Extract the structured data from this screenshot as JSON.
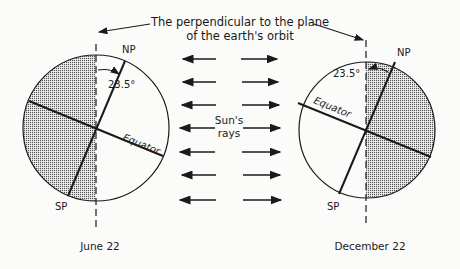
{
  "title_line1": "The perpendicular to the plane",
  "title_line2": "of the earth's orbit",
  "left": {
    "date": "June 22",
    "north_pole": "NP",
    "south_pole": "SP",
    "angle": "23.5°",
    "equator": "Equator"
  },
  "right": {
    "date": "December 22",
    "north_pole": "NP",
    "south_pole": "SP",
    "angle": "23.5°",
    "equator": "Equator"
  },
  "sun": {
    "line1": "Sun's",
    "line2": "rays",
    "arrow_rows": 7
  },
  "colors": {
    "ink": "#1a1a1a",
    "shade": "#9a9a9a",
    "paper": "#fbfbf9"
  }
}
